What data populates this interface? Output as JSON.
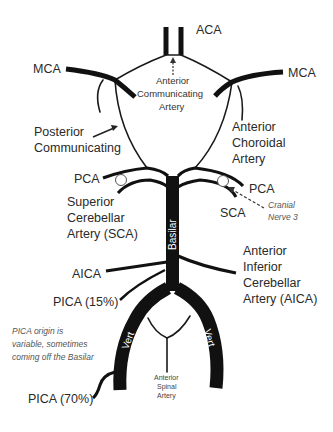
{
  "diagram": {
    "colors": {
      "vessel": "#111111",
      "text": "#2a2a2a",
      "background": "#ffffff"
    },
    "labels": {
      "aca": "ACA",
      "mca_left": "MCA",
      "mca_right": "MCA",
      "acomm_line1": "Anterior",
      "acomm_line2": "Communicating",
      "acomm_line3": "Artery",
      "pcomm_line1": "Posterior",
      "pcomm_line2": "Communicating",
      "achor_line1": "Anterior",
      "achor_line2": "Choroidal",
      "achor_line3": "Artery",
      "pca_left": "PCA",
      "pca_right": "PCA",
      "sca_left_line1": "Superior",
      "sca_left_line2": "Cerebellar",
      "sca_left_line3": "Artery (SCA)",
      "sca_right": "SCA",
      "cn3_line1": "Cranial",
      "cn3_line2": "Nerve 3",
      "basilar": "Basilar",
      "aica_left": "AICA",
      "aica_right_line1": "Anterior",
      "aica_right_line2": "Inferior",
      "aica_right_line3": "Cerebellar",
      "aica_right_line4": "Artery (AICA)",
      "pica15": "PICA (15%)",
      "pica_note_line1": "PICA origin is",
      "pica_note_line2": "variable, sometimes",
      "pica_note_line3": "coming off the Basilar",
      "vert_left": "Vert",
      "vert_right": "Vert",
      "asa_line1": "Anterior",
      "asa_line2": "Spinal",
      "asa_line3": "Artery",
      "pica70": "PICA (70%)"
    }
  }
}
